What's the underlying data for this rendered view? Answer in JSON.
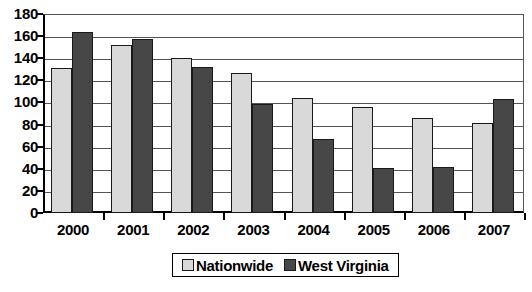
{
  "chart_data": {
    "type": "bar",
    "title": "",
    "xlabel": "",
    "ylabel": "",
    "categories": [
      "2000",
      "2001",
      "2002",
      "2003",
      "2004",
      "2005",
      "2006",
      "2007"
    ],
    "series": [
      {
        "name": "Nationwide",
        "color": "#d9d9d9",
        "values": [
          131,
          152,
          140,
          127,
          104,
          96,
          86,
          81
        ]
      },
      {
        "name": "West Virginia",
        "color": "#474747",
        "values": [
          164,
          157,
          132,
          99,
          67,
          41,
          42,
          103
        ]
      }
    ],
    "ylim": [
      0,
      180
    ],
    "ytick_values": [
      180,
      160,
      140,
      120,
      100,
      80,
      60,
      40,
      20,
      0
    ],
    "ytick_labels": [
      "180",
      "160",
      "140",
      "120",
      "100",
      "80",
      "60",
      "40",
      "20",
      "0"
    ],
    "grid": true,
    "legend_position": "bottom"
  },
  "legend": {
    "entries": [
      {
        "label": "Nationwide",
        "swatch": "light-gray-swatch"
      },
      {
        "label": "West Virginia",
        "swatch": "dark-gray-swatch"
      }
    ]
  }
}
